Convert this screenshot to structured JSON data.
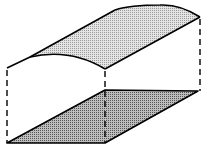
{
  "diagram": {
    "colors": {
      "stroke": "#000000",
      "top_fill": "#d8d8d8",
      "base_fill": "#a8a8a8",
      "background": "#ffffff"
    }
  }
}
